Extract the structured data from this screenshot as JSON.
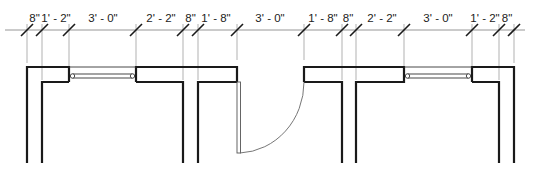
{
  "drawing": {
    "type": "floor-plan-partial",
    "dimension_string": {
      "baseline_y": 30,
      "segments": [
        {
          "label": "8\"",
          "from_x": 27,
          "to_x": 42
        },
        {
          "label": "1' - 2\"",
          "from_x": 42,
          "to_x": 69
        },
        {
          "label": "3' - 0\"",
          "from_x": 69,
          "to_x": 136
        },
        {
          "label": "2' - 2\"",
          "from_x": 136,
          "to_x": 183
        },
        {
          "label": "8\"",
          "from_x": 183,
          "to_x": 198
        },
        {
          "label": "1' - 8\"",
          "from_x": 198,
          "to_x": 237
        },
        {
          "label": "3' - 0\"",
          "from_x": 237,
          "to_x": 304
        },
        {
          "label": "1' - 8\"",
          "from_x": 304,
          "to_x": 342
        },
        {
          "label": "8\"",
          "from_x": 342,
          "to_x": 356
        },
        {
          "label": "2' - 2\"",
          "from_x": 356,
          "to_x": 404
        },
        {
          "label": "3' - 0\"",
          "from_x": 404,
          "to_x": 472
        },
        {
          "label": "1' - 2\"",
          "from_x": 472,
          "to_x": 499
        },
        {
          "label": "8\"",
          "from_x": 499,
          "to_x": 514
        }
      ]
    },
    "elements": {
      "windows": [
        {
          "label": "window-left",
          "x1": 69,
          "x2": 136
        },
        {
          "label": "window-right",
          "x1": 404,
          "x2": 472
        }
      ],
      "doors": [
        {
          "label": "door-center",
          "hinge_x": 237,
          "width_x": 304
        }
      ],
      "colors": {
        "wall": "#1a1a1a",
        "dimension_line": "#8a8a8a",
        "extension_line": "#a8a8a8",
        "text": "#222222",
        "background": "#ffffff"
      }
    }
  }
}
